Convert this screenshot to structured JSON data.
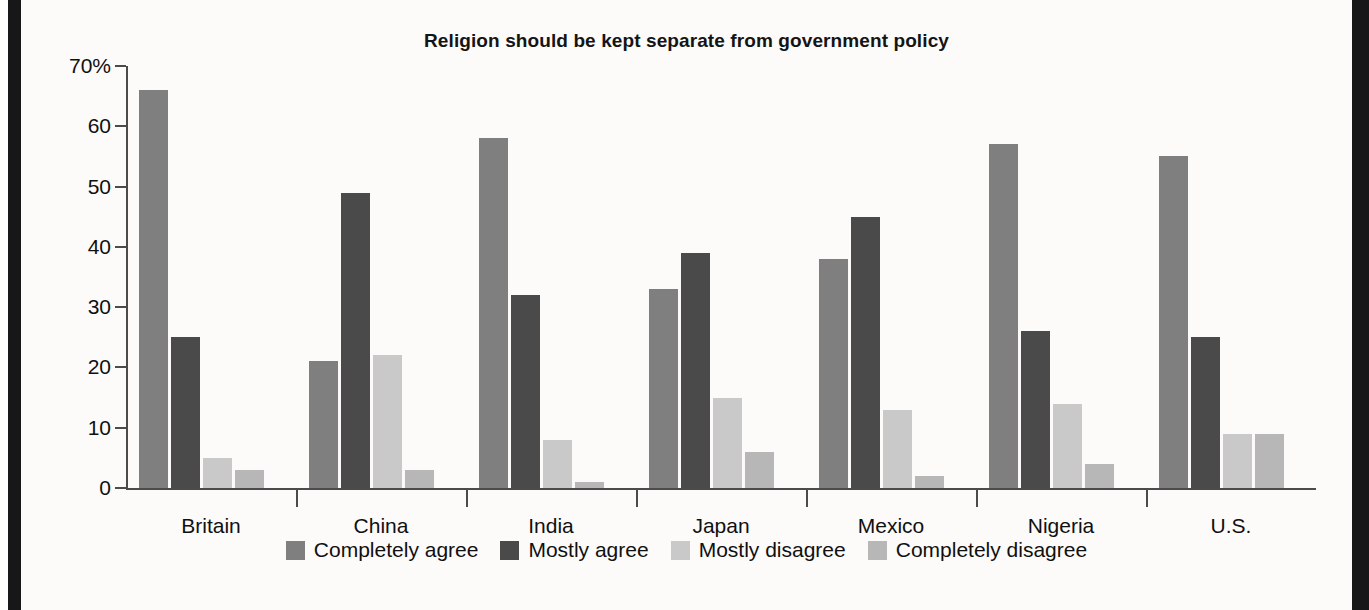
{
  "chart_data": {
    "type": "bar",
    "title": "Religion should be kept separate from government policy",
    "xlabel": "",
    "ylabel": "",
    "ylim": [
      0,
      70
    ],
    "yticks": [
      0,
      10,
      20,
      30,
      40,
      50,
      60,
      70
    ],
    "ytick_labels": [
      "0",
      "10",
      "20",
      "30",
      "40",
      "50",
      "60",
      "70%"
    ],
    "grid": false,
    "legend_position": "bottom",
    "categories": [
      "Britain",
      "China",
      "India",
      "Japan",
      "Mexico",
      "Nigeria",
      "U.S."
    ],
    "series": [
      {
        "name": "Completely agree",
        "color": "#7f7f7f",
        "values": [
          66,
          21,
          58,
          33,
          38,
          57,
          55
        ]
      },
      {
        "name": "Mostly agree",
        "color": "#4a4a4a",
        "values": [
          25,
          49,
          32,
          39,
          45,
          26,
          25
        ]
      },
      {
        "name": "Mostly disagree",
        "color": "#c9c9c9",
        "values": [
          5,
          22,
          8,
          15,
          13,
          14,
          9
        ]
      },
      {
        "name": "Completely disagree",
        "color": "#b7b7b7",
        "values": [
          3,
          3,
          1,
          6,
          2,
          4,
          9
        ]
      }
    ]
  },
  "colors": {
    "axis": "#4b4b4b",
    "text": "#101010",
    "page_background": "#fcfbfa",
    "edge_band": "#17171a"
  }
}
